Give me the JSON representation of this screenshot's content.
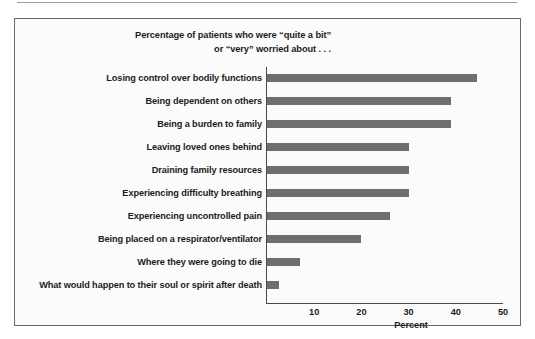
{
  "chart_data": {
    "type": "bar",
    "orientation": "horizontal",
    "title": "Percentage of patients who were “quite a bit” or “very” worried about . . .",
    "title_lines": [
      "Percentage of patients who were “quite a bit”",
      "or “very” worried about . . ."
    ],
    "xlabel": "Percent",
    "ylabel": "",
    "xlim": [
      0,
      50
    ],
    "xticks": [
      10,
      20,
      30,
      40,
      50
    ],
    "xtick_labels": [
      "10",
      "20",
      "30",
      "40",
      "50"
    ],
    "grid": false,
    "legend": null,
    "bar_color": "#6e6e6e",
    "categories": [
      "Losing control over bodily functions",
      "Being dependent on others",
      "Being a burden to family",
      "Leaving loved ones behind",
      "Draining family resources",
      "Experiencing difficulty breathing",
      "Experiencing uncontrolled pain",
      "Being placed on a respirator/ventilator",
      "Where they were going to die",
      "What would happen to their soul or spirit after death"
    ],
    "values": [
      44.5,
      39,
      39,
      30,
      30,
      30,
      26,
      20,
      7,
      2.5
    ]
  }
}
